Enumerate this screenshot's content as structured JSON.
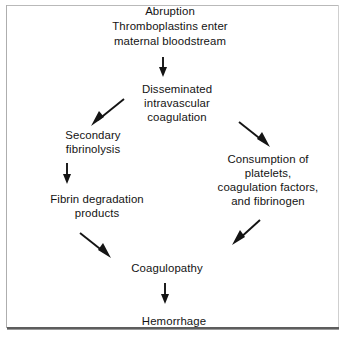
{
  "figure": {
    "type": "flowchart",
    "title": "",
    "orientation": "top-to-bottom",
    "background_color": "#ffffff",
    "text_color": "#131313",
    "arrow_color": "#141414",
    "border_color": "#aeaeae"
  },
  "nodes": [
    {
      "id": "abruption",
      "lines": [
        "Abruption",
        "Thromboplastins enter",
        "maternal bloodstream"
      ],
      "line1": "Abruption",
      "line2": "Thromboplastins enter",
      "line3": "maternal bloodstream"
    },
    {
      "id": "dic",
      "lines": [
        "Disseminated",
        "intravascular",
        "coagulation"
      ],
      "line1": "Disseminated",
      "line2": "intravascular",
      "line3": "coagulation"
    },
    {
      "id": "secondary-fibrinolysis",
      "lines": [
        "Secondary",
        "fibrinolysis"
      ],
      "line1": "Secondary",
      "line2": "fibrinolysis"
    },
    {
      "id": "consumption",
      "lines": [
        "Consumption of",
        "platelets,",
        "coagulation factors,",
        "and fibrinogen"
      ],
      "line1": "Consumption of",
      "line2": "platelets,",
      "line3": "coagulation factors,",
      "line4": "and fibrinogen"
    },
    {
      "id": "fdp",
      "lines": [
        "Fibrin degradation",
        "products"
      ],
      "line1": "Fibrin degradation",
      "line2": "products"
    },
    {
      "id": "coagulopathy",
      "lines": [
        "Coagulopathy"
      ],
      "line1": "Coagulopathy"
    },
    {
      "id": "hemorrhage",
      "lines": [
        "Hemorrhage"
      ],
      "line1": "Hemorrhage"
    }
  ],
  "edges": [
    {
      "id": "abruption-to-dic",
      "from": "abruption",
      "to": "dic",
      "direction": "down",
      "label": ""
    },
    {
      "id": "dic-to-secondary-fibrinolysis",
      "from": "dic",
      "to": "secondary-fibrinolysis",
      "direction": "down-left",
      "label": ""
    },
    {
      "id": "dic-to-consumption",
      "from": "dic",
      "to": "consumption",
      "direction": "down-right",
      "label": ""
    },
    {
      "id": "secondary-fibrinolysis-to-fdp",
      "from": "secondary-fibrinolysis",
      "to": "fdp",
      "direction": "down",
      "label": ""
    },
    {
      "id": "fdp-to-coagulopathy",
      "from": "fdp",
      "to": "coagulopathy",
      "direction": "down-right",
      "label": ""
    },
    {
      "id": "consumption-to-coagulopathy",
      "from": "consumption",
      "to": "coagulopathy",
      "direction": "down-left",
      "label": ""
    },
    {
      "id": "coagulopathy-to-hemorrhage",
      "from": "coagulopathy",
      "to": "hemorrhage",
      "direction": "down",
      "label": ""
    }
  ]
}
